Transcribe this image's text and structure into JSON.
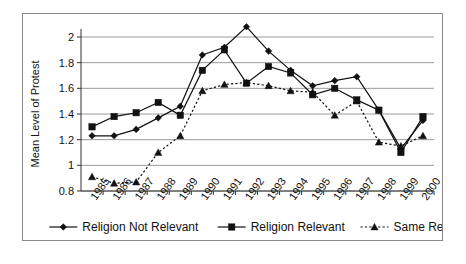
{
  "chart_data": {
    "type": "line",
    "title": "",
    "xlabel": "",
    "ylabel": "Mean Level of Protest",
    "ylim": [
      0.8,
      2.0
    ],
    "yticks": [
      0.8,
      1,
      1.2,
      1.4,
      1.6,
      1.8,
      2
    ],
    "ytick_labels": [
      "0.8",
      "1",
      "1.2",
      "1.4",
      "1.6",
      "1.8",
      "2"
    ],
    "grid": true,
    "legend_position": "bottom",
    "categories": [
      "1985",
      "1986",
      "1987",
      "1988",
      "1989",
      "1990",
      "1991",
      "1992",
      "1993",
      "1994",
      "1995",
      "1996",
      "1997",
      "1998",
      "1999",
      "2000"
    ],
    "series": [
      {
        "name": "Religion Not Relevant",
        "marker": "diamond",
        "linestyle": "solid",
        "values": [
          1.23,
          1.23,
          1.28,
          1.37,
          1.46,
          1.86,
          1.92,
          2.08,
          1.89,
          1.74,
          1.62,
          1.66,
          1.69,
          1.43,
          1.13,
          1.35
        ]
      },
      {
        "name": "Religion Relevant",
        "marker": "square",
        "linestyle": "solid",
        "values": [
          1.3,
          1.38,
          1.41,
          1.49,
          1.39,
          1.74,
          1.9,
          1.64,
          1.77,
          1.72,
          1.55,
          1.6,
          1.51,
          1.43,
          1.1,
          1.38
        ]
      },
      {
        "name": "Same Religion",
        "marker": "triangle",
        "linestyle": "dotted",
        "values": [
          0.91,
          0.86,
          0.87,
          1.1,
          1.23,
          1.58,
          1.63,
          1.645,
          1.62,
          1.58,
          1.57,
          1.39,
          1.5,
          1.18,
          1.15,
          1.23
        ]
      }
    ]
  }
}
